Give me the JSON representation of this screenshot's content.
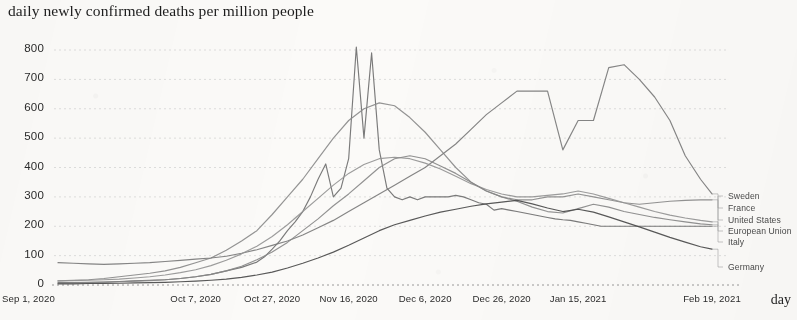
{
  "chart_title": "daily newly confirmed deaths per million people",
  "axis": {
    "x_title": "day",
    "y_ticks": [
      "0",
      "100",
      "200",
      "300",
      "400",
      "500",
      "600",
      "700",
      "800"
    ],
    "x_ticks": [
      "Sep 1, 2020",
      "Oct 7, 2020",
      "Oct 27, 2020",
      "Nov 16, 2020",
      "Dec 6, 2020",
      "Dec 26, 2020",
      "Jan 15, 2021",
      "Feb 19, 2021"
    ]
  },
  "legend": {
    "items": [
      {
        "label": "Sweden"
      },
      {
        "label": "France"
      },
      {
        "label": "United States"
      },
      {
        "label": "European Union"
      },
      {
        "label": "Italy"
      },
      {
        "label": "Germany"
      }
    ]
  },
  "chart_data": {
    "type": "line",
    "title": "daily newly confirmed deaths per million people",
    "xlabel": "day",
    "ylabel": "daily newly confirmed deaths per million people",
    "ylim": [
      0,
      850
    ],
    "xlim": [
      0,
      171
    ],
    "grid": true,
    "legend_position": "right",
    "x_tick_labels": [
      "Sep 1, 2020",
      "Oct 7, 2020",
      "Oct 27, 2020",
      "Nov 16, 2020",
      "Dec 6, 2020",
      "Dec 26, 2020",
      "Jan 15, 2021",
      "Feb 19, 2021"
    ],
    "x_tick_values": [
      0,
      36,
      56,
      76,
      96,
      116,
      136,
      171
    ],
    "y_tick_values": [
      0,
      100,
      200,
      300,
      400,
      500,
      600,
      700,
      800
    ],
    "x_unit": "days since Sep 1, 2020",
    "series": [
      {
        "name": "Sweden",
        "color": "#6f6f6f",
        "x": [
          0,
          4,
          8,
          12,
          16,
          20,
          24,
          28,
          32,
          36,
          40,
          44,
          48,
          52,
          54,
          56,
          58,
          60,
          62,
          64,
          66,
          68,
          70,
          72,
          74,
          76,
          78,
          80,
          82,
          84,
          86,
          88,
          90,
          92,
          94,
          96,
          98,
          100,
          102,
          104,
          106,
          108,
          110,
          112,
          114,
          116,
          118,
          120,
          122,
          124,
          126,
          128,
          130,
          132,
          134,
          136,
          138,
          140,
          142,
          144,
          146,
          148,
          150,
          152,
          154,
          156,
          158,
          160,
          162,
          164,
          166,
          168,
          171
        ],
        "y": [
          8,
          8,
          9,
          10,
          12,
          14,
          16,
          18,
          22,
          28,
          36,
          48,
          60,
          78,
          96,
          122,
          150,
          185,
          215,
          250,
          300,
          360,
          412,
          300,
          330,
          430,
          810,
          500,
          790,
          460,
          330,
          300,
          290,
          300,
          290,
          300,
          300,
          300,
          300,
          305,
          300,
          290,
          280,
          275,
          255,
          260,
          255,
          250,
          245,
          240,
          235,
          230,
          225,
          222,
          220,
          215,
          210,
          205,
          200,
          200,
          200,
          200,
          200,
          200,
          200,
          200,
          200,
          200,
          200,
          200,
          200,
          200,
          200
        ]
      },
      {
        "name": "France",
        "color": "#8a8a8a",
        "x": [
          0,
          4,
          8,
          12,
          16,
          20,
          24,
          28,
          32,
          36,
          40,
          44,
          48,
          52,
          56,
          60,
          64,
          68,
          72,
          76,
          80,
          84,
          88,
          92,
          96,
          100,
          104,
          108,
          112,
          116,
          120,
          124,
          128,
          132,
          136,
          140,
          144,
          148,
          152,
          156,
          160,
          164,
          168,
          171
        ],
        "y": [
          14,
          16,
          18,
          22,
          28,
          34,
          40,
          48,
          60,
          76,
          92,
          118,
          150,
          185,
          240,
          300,
          360,
          430,
          500,
          560,
          600,
          620,
          610,
          570,
          520,
          460,
          400,
          350,
          320,
          300,
          290,
          290,
          300,
          300,
          310,
          300,
          290,
          280,
          275,
          280,
          285,
          288,
          290,
          290
        ]
      },
      {
        "name": "United States",
        "color": "#7b7b7b",
        "x": [
          0,
          4,
          8,
          12,
          16,
          20,
          24,
          28,
          32,
          36,
          40,
          44,
          48,
          52,
          56,
          60,
          64,
          68,
          72,
          76,
          80,
          84,
          88,
          92,
          96,
          100,
          104,
          108,
          112,
          116,
          120,
          124,
          128,
          132,
          136,
          140,
          144,
          148,
          152,
          156,
          160,
          164,
          168,
          171
        ],
        "y": [
          76,
          74,
          72,
          70,
          72,
          74,
          76,
          80,
          84,
          88,
          92,
          98,
          108,
          120,
          135,
          150,
          170,
          195,
          220,
          250,
          280,
          310,
          340,
          370,
          400,
          440,
          480,
          530,
          580,
          620,
          660,
          660,
          660,
          460,
          560,
          560,
          740,
          750,
          700,
          640,
          560,
          440,
          360,
          310
        ]
      },
      {
        "name": "European Union",
        "color": "#949494",
        "x": [
          0,
          4,
          8,
          12,
          16,
          20,
          24,
          28,
          32,
          36,
          40,
          44,
          48,
          52,
          56,
          60,
          64,
          68,
          72,
          76,
          80,
          84,
          88,
          92,
          96,
          100,
          104,
          108,
          112,
          116,
          120,
          124,
          128,
          132,
          136,
          140,
          144,
          148,
          152,
          156,
          160,
          164,
          168,
          171
        ],
        "y": [
          14,
          15,
          16,
          18,
          20,
          24,
          28,
          34,
          42,
          52,
          66,
          84,
          106,
          132,
          165,
          205,
          250,
          295,
          340,
          380,
          410,
          430,
          435,
          430,
          415,
          395,
          370,
          345,
          325,
          310,
          300,
          300,
          305,
          310,
          320,
          310,
          295,
          280,
          265,
          250,
          238,
          228,
          220,
          215
        ]
      },
      {
        "name": "Italy",
        "color": "#888888",
        "x": [
          0,
          4,
          8,
          12,
          16,
          20,
          24,
          28,
          32,
          36,
          40,
          44,
          48,
          52,
          56,
          60,
          64,
          68,
          72,
          76,
          80,
          84,
          88,
          92,
          96,
          100,
          104,
          108,
          112,
          116,
          120,
          124,
          128,
          132,
          136,
          140,
          144,
          148,
          152,
          156,
          160,
          164,
          168,
          171
        ],
        "y": [
          6,
          7,
          8,
          9,
          11,
          13,
          15,
          18,
          22,
          28,
          36,
          48,
          64,
          86,
          112,
          145,
          185,
          225,
          270,
          310,
          355,
          400,
          430,
          440,
          430,
          405,
          380,
          350,
          320,
          300,
          285,
          265,
          250,
          245,
          260,
          275,
          265,
          250,
          240,
          230,
          222,
          215,
          208,
          205
        ]
      },
      {
        "name": "Germany",
        "color": "#4a4a4a",
        "x": [
          0,
          4,
          8,
          12,
          16,
          20,
          24,
          28,
          32,
          36,
          40,
          44,
          48,
          52,
          56,
          60,
          64,
          68,
          72,
          76,
          80,
          84,
          88,
          92,
          96,
          100,
          104,
          108,
          112,
          116,
          120,
          124,
          128,
          132,
          136,
          140,
          144,
          148,
          152,
          156,
          160,
          164,
          168,
          171
        ],
        "y": [
          4,
          4,
          5,
          5,
          6,
          7,
          8,
          9,
          11,
          13,
          16,
          20,
          26,
          34,
          44,
          58,
          74,
          92,
          112,
          135,
          160,
          185,
          205,
          220,
          235,
          248,
          258,
          268,
          276,
          282,
          288,
          276,
          262,
          250,
          258,
          248,
          232,
          215,
          198,
          180,
          162,
          146,
          130,
          122
        ]
      }
    ]
  }
}
